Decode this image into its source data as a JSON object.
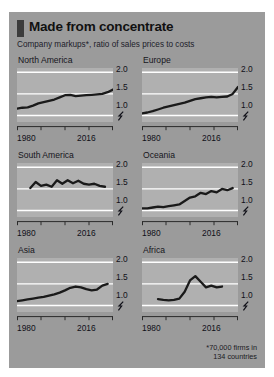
{
  "card": {
    "accent_color": "#3c3c3c",
    "background_color": "#9b9b9b",
    "panel_color": "#b0b0b0",
    "line_color": "#1a1a1a",
    "gridline_color": "#ffffff"
  },
  "header": {
    "title": "Made from concentrate",
    "subtitle": "Company markups*, ratio of sales prices to costs"
  },
  "footnote": "*70,000 firms in\n134 countries",
  "axis": {
    "y_ticks": [
      "2.0",
      "1.5",
      "1.0"
    ],
    "x_start": "1980",
    "x_end": "2016",
    "break_symbol": "axis-break-zigzag"
  },
  "chart_data": {
    "type": "line",
    "title": "Made from concentrate",
    "subtitle": "Company markups*, ratio of sales prices to costs",
    "xlabel": "",
    "ylabel": "ratio of sales prices to costs",
    "xlim": [
      1980,
      2016
    ],
    "ylim": [
      0.85,
      2.1
    ],
    "yticks": [
      1.0,
      1.5,
      2.0
    ],
    "xticks": [
      1980,
      1989,
      1998,
      2007,
      2016
    ],
    "grid": true,
    "legend": "none",
    "note": "Small multiples: one panel per region, shared axes, y-axis truncated below 1.0 (axis-break glyph shown).",
    "panels": [
      {
        "name": "North America",
        "row": 0,
        "col": 0,
        "x": [
          1980,
          1982,
          1984,
          1986,
          1988,
          1990,
          1992,
          1994,
          1996,
          1998,
          2000,
          2002,
          2004,
          2006,
          2008,
          2010,
          2012,
          2014,
          2016
        ],
        "values": [
          1.16,
          1.18,
          1.19,
          1.23,
          1.28,
          1.31,
          1.34,
          1.37,
          1.42,
          1.47,
          1.48,
          1.45,
          1.46,
          1.47,
          1.48,
          1.49,
          1.5,
          1.54,
          1.6
        ]
      },
      {
        "name": "Europe",
        "row": 0,
        "col": 1,
        "x": [
          1980,
          1982,
          1984,
          1986,
          1988,
          1990,
          1992,
          1994,
          1996,
          1998,
          2000,
          2002,
          2004,
          2006,
          2008,
          2010,
          2012,
          2014,
          2016
        ],
        "values": [
          1.05,
          1.07,
          1.1,
          1.14,
          1.18,
          1.21,
          1.24,
          1.27,
          1.3,
          1.34,
          1.38,
          1.4,
          1.42,
          1.43,
          1.42,
          1.43,
          1.44,
          1.5,
          1.66
        ]
      },
      {
        "name": "South America",
        "row": 1,
        "col": 0,
        "x": [
          1985,
          1987,
          1989,
          1991,
          1993,
          1995,
          1997,
          1999,
          2001,
          2003,
          2005,
          2007,
          2009,
          2011,
          2013
        ],
        "values": [
          1.52,
          1.66,
          1.57,
          1.6,
          1.55,
          1.7,
          1.62,
          1.7,
          1.63,
          1.69,
          1.62,
          1.6,
          1.62,
          1.57,
          1.55
        ]
      },
      {
        "name": "Oceania",
        "row": 1,
        "col": 1,
        "x": [
          1980,
          1982,
          1984,
          1986,
          1988,
          1990,
          1992,
          1994,
          1996,
          1998,
          2000,
          2002,
          2004,
          2006,
          2008,
          2010,
          2012,
          2014
        ],
        "values": [
          1.05,
          1.05,
          1.07,
          1.09,
          1.08,
          1.1,
          1.12,
          1.14,
          1.22,
          1.3,
          1.33,
          1.41,
          1.38,
          1.45,
          1.42,
          1.5,
          1.47,
          1.52
        ]
      },
      {
        "name": "Asia",
        "row": 2,
        "col": 0,
        "x": [
          1980,
          1982,
          1984,
          1986,
          1988,
          1990,
          1992,
          1994,
          1996,
          1998,
          2000,
          2002,
          2004,
          2006,
          2008,
          2010,
          2012,
          2014
        ],
        "values": [
          1.1,
          1.12,
          1.14,
          1.16,
          1.18,
          1.2,
          1.23,
          1.26,
          1.3,
          1.35,
          1.41,
          1.44,
          1.42,
          1.38,
          1.35,
          1.37,
          1.46,
          1.5
        ]
      },
      {
        "name": "Africa",
        "row": 2,
        "col": 1,
        "x": [
          1986,
          1988,
          1990,
          1992,
          1994,
          1996,
          1998,
          2000,
          2002,
          2004,
          2006,
          2008,
          2010
        ],
        "values": [
          1.15,
          1.13,
          1.12,
          1.13,
          1.16,
          1.32,
          1.58,
          1.68,
          1.55,
          1.42,
          1.46,
          1.42,
          1.44
        ]
      }
    ]
  }
}
